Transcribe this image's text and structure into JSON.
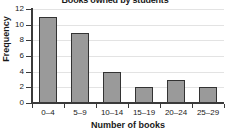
{
  "chart_data": {
    "type": "bar",
    "title": "Books owned by students",
    "xlabel": "Number of books",
    "ylabel": "Frequency",
    "categories": [
      "0–4",
      "5–9",
      "10–14",
      "15–19",
      "20–24",
      "25–29"
    ],
    "values": [
      11,
      9,
      4,
      2,
      3,
      2
    ],
    "ylim": [
      0,
      12
    ],
    "ytick_labels": [
      "0",
      "2",
      "4",
      "6",
      "8",
      "10",
      "12"
    ],
    "ytick_values": [
      0,
      2,
      4,
      6,
      8,
      10,
      12
    ],
    "grid": "horizontal",
    "legend": "none",
    "bar_fill_color": "#9a9a9a",
    "bar_edge_color": "#333333",
    "gridline_color": "#e3e3e3",
    "axis_color": "#3a3a3a"
  }
}
